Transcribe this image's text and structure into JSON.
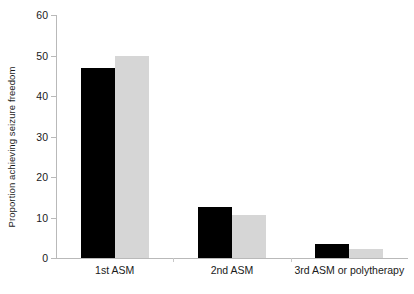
{
  "chart_data": {
    "type": "bar",
    "title": "",
    "subtitle": "",
    "xlabel": "",
    "ylabel": "Proportion achieving seizure freedom",
    "categories": [
      "1st ASM",
      "2nd ASM",
      "3rd ASM or polytherapy"
    ],
    "series": [
      {
        "name": "black-series",
        "color": "#000000",
        "values": [
          47,
          12.5,
          3.5
        ]
      },
      {
        "name": "grey-series",
        "color": "#d6d6d6",
        "values": [
          50,
          10.5,
          2.2
        ]
      }
    ],
    "ylim": [
      0,
      60
    ],
    "yticks": [
      0,
      10,
      20,
      30,
      40,
      50,
      60
    ],
    "ytick_labels": [
      "0",
      "10",
      "20",
      "30",
      "40",
      "50",
      "60"
    ],
    "grid": false,
    "legend": "none",
    "axis_color": "#b9b9b9"
  }
}
